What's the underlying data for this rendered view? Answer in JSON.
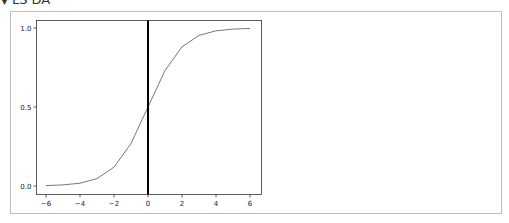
{
  "header": {
    "toggle_icon": "▼",
    "title": "LS DA"
  },
  "chart_data": {
    "type": "line",
    "title": "",
    "xlabel": "",
    "ylabel": "",
    "xlim": [
      -6.6,
      6.6
    ],
    "ylim": [
      -0.05,
      1.05
    ],
    "grid": false,
    "legend": null,
    "x": [
      -6,
      -5,
      -4,
      -3,
      -2,
      -1,
      0,
      1,
      2,
      3,
      4,
      5,
      6
    ],
    "series": [
      {
        "name": "sigmoid",
        "color": "#555555",
        "values": [
          0.0025,
          0.0067,
          0.018,
          0.047,
          0.119,
          0.269,
          0.5,
          0.731,
          0.881,
          0.953,
          0.982,
          0.993,
          0.9975
        ]
      }
    ],
    "annotations": [
      {
        "type": "vline",
        "x": 0,
        "color": "#000000",
        "width": 2
      }
    ],
    "x_ticks": [
      "−6",
      "−4",
      "−2",
      "0",
      "2",
      "4",
      "6"
    ],
    "x_tick_values": [
      -6,
      -4,
      -2,
      0,
      2,
      4,
      6
    ],
    "y_ticks": [
      "0.0",
      "0.5",
      "1.0"
    ],
    "y_tick_values": [
      0.0,
      0.5,
      1.0
    ]
  }
}
